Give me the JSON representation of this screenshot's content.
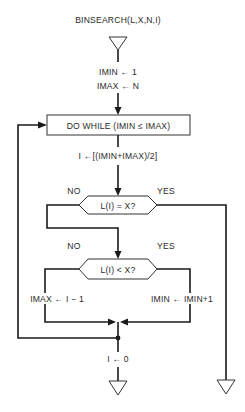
{
  "diagram": {
    "title": "BINSEARCH(L,X,N,I)",
    "init": {
      "line1": "IMIN ← 1",
      "line2": "IMAX ← N"
    },
    "loop": {
      "label": "DO WHILE (IMIN ≤ IMAX)"
    },
    "midpoint": {
      "label": "I ←[(IMIN+IMAX)/2]"
    },
    "decision1": {
      "label": "L(I) = X?",
      "no_label": "NO",
      "yes_label": "YES"
    },
    "decision2": {
      "label": "L(I) < X?",
      "no_label": "NO",
      "yes_label": "YES"
    },
    "no_branch_action": "IMAX ← I − 1",
    "yes_branch_action": "IMIN ← IMIN+1",
    "not_found_action": "I ← 0",
    "terminals": {
      "start": "start-connector",
      "end_not_found": "exit-connector",
      "end_found": "exit-connector"
    }
  }
}
